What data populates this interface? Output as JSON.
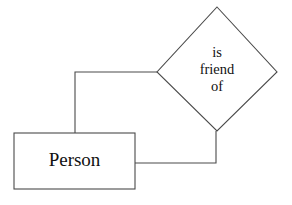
{
  "diagram": {
    "type": "entity-relationship-diagram",
    "background_color": "#ffffff",
    "line_color": "#4a4a4a",
    "text_color": "#111111",
    "entity": {
      "label": "Person",
      "shape": "rectangle",
      "x": 14,
      "y": 133,
      "width": 121,
      "height": 56
    },
    "relationship": {
      "shape": "diamond",
      "label_lines": [
        "is",
        "friend",
        "of"
      ],
      "line1": "is",
      "line2": "friend",
      "line3": "of",
      "center_x": 217,
      "center_y": 69,
      "half_width": 60,
      "half_height": 62
    },
    "connectors": [
      {
        "name": "left-connector",
        "path": "M 157 72 L 75 72 L 75 133"
      },
      {
        "name": "right-connector",
        "path": "M 135 163 L 216 163 L 216 131"
      }
    ]
  }
}
